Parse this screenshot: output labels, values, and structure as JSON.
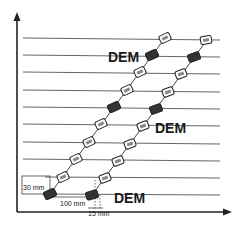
{
  "diagram": {
    "type": "sensor-array-layout",
    "axes": {
      "x_arrow": true,
      "y_arrow": true
    },
    "horizontal_lines": 10,
    "labels": {
      "dem_top": "DEM",
      "dem_middle": "DEM",
      "dem_bottom": "DEM",
      "dim_vertical": "30 mm",
      "dim_horizontal": "100 mm",
      "dim_offset": "15 mm"
    },
    "chains": [
      {
        "name": "left-chain",
        "sensors": 10,
        "dark_sensor_indices": [
          0,
          5,
          8
        ]
      },
      {
        "name": "right-chain",
        "sensors": 10,
        "dark_sensor_indices": [
          0,
          5,
          8
        ]
      }
    ],
    "colors": {
      "line": "#555555",
      "sensor_dark": "#333333",
      "sensor_light": "#ffffff",
      "text": "#1a1a1a"
    }
  }
}
